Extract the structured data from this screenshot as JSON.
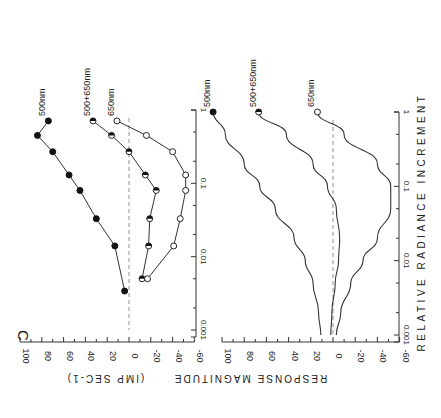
{
  "panel_label": "C",
  "orientation": "rotated 90 degrees clockwise",
  "xlabel": "RELATIVE RADIANCE INCREMENT",
  "ylabel_top": "(IMP SEC-1)",
  "ylabel_bottom": "RESPONSE MAGNITUDE",
  "chart_data": [
    {
      "type": "line",
      "title": "Measured responses (top panel)",
      "xlabel": "RELATIVE RADIANCE INCREMENT",
      "ylabel": "RESPONSE MAGNITUDE (IMP SEC-1)",
      "xscale": "log",
      "xlim": [
        0.001,
        1
      ],
      "x_ticks": [
        "0.001",
        "0.01",
        "0.1",
        "1"
      ],
      "ylim": [
        -60,
        100
      ],
      "y_ticks": [
        "100",
        "80",
        "60",
        "40",
        "20",
        "0",
        "-20",
        "-40",
        "-60"
      ],
      "zero_line": "dashed",
      "series": [
        {
          "name": "500nm",
          "marker": "filled",
          "x": [
            0.0034,
            0.014,
            0.033,
            0.08,
            0.13,
            0.27,
            0.45,
            0.71
          ],
          "y": [
            4,
            13,
            30,
            45,
            55,
            70,
            84,
            74
          ]
        },
        {
          "name": "500+650nm",
          "marker": "half-filled",
          "x": [
            0.005,
            0.014,
            0.033,
            0.08,
            0.13,
            0.27,
            0.45,
            0.71
          ],
          "y": [
            -12,
            -18,
            -19,
            -25,
            -15,
            0,
            16,
            33
          ]
        },
        {
          "name": "650nm",
          "marker": "open",
          "x": [
            0.005,
            0.014,
            0.033,
            0.08,
            0.13,
            0.27,
            0.45,
            0.71
          ],
          "y": [
            -17,
            -41,
            -47,
            -52,
            -52,
            -40,
            -16,
            11
          ]
        }
      ]
    },
    {
      "type": "line",
      "title": "Model curves (bottom panel)",
      "xlabel": "RELATIVE RADIANCE INCREMENT",
      "ylabel": "RESPONSE MAGNITUDE",
      "xscale": "log",
      "xlim": [
        0.001,
        1
      ],
      "x_ticks": [
        "0.001",
        "0.01",
        "0.1",
        "1"
      ],
      "ylim": [
        -60,
        100
      ],
      "y_ticks": [
        "100",
        "80",
        "60",
        "40",
        "20",
        "0",
        "-20",
        "-40",
        "-60"
      ],
      "zero_line": "dashed",
      "series": [
        {
          "name": "500nm",
          "marker_at_end": "filled",
          "x": [
            0.001,
            0.002,
            0.005,
            0.01,
            0.02,
            0.05,
            0.1,
            0.2,
            0.5,
            1
          ],
          "y": [
            11,
            13,
            18,
            25,
            35,
            52,
            66,
            80,
            97,
            108
          ]
        },
        {
          "name": "500+650nm",
          "marker_at_end": "half-filled",
          "x": [
            0.001,
            0.002,
            0.005,
            0.01,
            0.02,
            0.05,
            0.1,
            0.2,
            0.5,
            1
          ],
          "y": [
            2,
            1,
            -2,
            -5,
            -6,
            -3,
            5,
            18,
            42,
            67
          ]
        },
        {
          "name": "650nm",
          "marker_at_end": "open",
          "x": [
            0.001,
            0.002,
            0.005,
            0.01,
            0.02,
            0.05,
            0.1,
            0.2,
            0.5,
            1
          ],
          "y": [
            -3,
            -7,
            -16,
            -27,
            -40,
            -52,
            -52,
            -40,
            -10,
            14
          ]
        }
      ]
    }
  ]
}
